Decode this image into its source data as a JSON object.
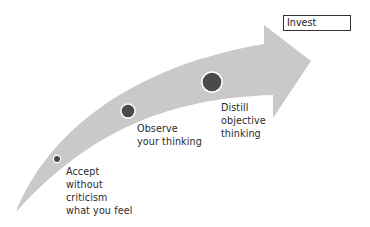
{
  "diagram": {
    "arrow": {
      "color": "#c9c9c9",
      "direction": "up-right"
    },
    "target_box": {
      "label": "Invest"
    },
    "steps": [
      {
        "id": 1,
        "label": "Accept\nwithout\ncriticism\nwhat you feel",
        "dot_size": "small",
        "dot_color": "#4a4a4a"
      },
      {
        "id": 2,
        "label": "Observe\nyour thinking",
        "dot_size": "medium",
        "dot_color": "#4a4a4a"
      },
      {
        "id": 3,
        "label": "Distill\nobjective\nthinking",
        "dot_size": "large",
        "dot_color": "#4a4a4a"
      }
    ]
  }
}
